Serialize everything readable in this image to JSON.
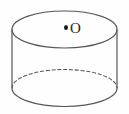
{
  "figure": {
    "name": "cylinder-diagram",
    "background_color": "#fefefe",
    "stroke_color": "#555555",
    "label_color": "#262626",
    "center_point": {
      "marker": "center-point-dot",
      "label": "O",
      "x": 66,
      "y": 28
    },
    "geometry": {
      "top_ellipse": {
        "cx": 64.5,
        "cy": 29.5,
        "rx": 52.5,
        "ry": 18.5,
        "style": "solid"
      },
      "bottom_ellipse": {
        "cx": 64.5,
        "cy": 88.0,
        "rx": 52.5,
        "ry": 18.5,
        "front_arc_style": "solid",
        "back_arc_style": "dashed"
      },
      "left_wall_x": 12,
      "right_wall_x": 117,
      "wall_top_y": 29.5,
      "wall_bottom_y": 88.0
    }
  }
}
